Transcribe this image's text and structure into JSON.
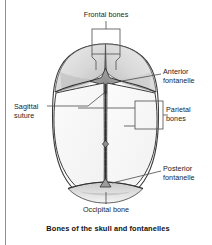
{
  "figure": {
    "caption": "Bones of the skull and fontanelles",
    "labels": {
      "frontal_bones": "Frontal bones",
      "anterior_fontanelle_line1": "Anterior",
      "anterior_fontanelle_line2": "fontanelle",
      "sagittal_suture_line1": "Sagittal",
      "sagittal_suture_line2": "suture",
      "parietal_bones_line1": "Parietal",
      "parietal_bones_line2": "bones",
      "posterior_fontanelle_line1": "Posterior",
      "posterior_fontanelle_line2": "fontanelle",
      "occipital_bone": "Occipital bone"
    },
    "colors": {
      "ink": "#1b1b1b",
      "outline": "#3a3a3a",
      "leader": "#555555",
      "bone_fill": "#ffffff",
      "frontal_shade": "#d9d9d9",
      "fontanelle_fill": "#9a9a9a",
      "occipital_shade": "#d2d2d2",
      "rule": "#8e8e8e",
      "background": "#ffffff"
    },
    "icons": {
      "anterior_fontanelle": "star-diamond-icon",
      "posterior_fontanelle": "triangle-fontanelle-icon",
      "suture_midpoint": "small-diamond-icon"
    }
  }
}
